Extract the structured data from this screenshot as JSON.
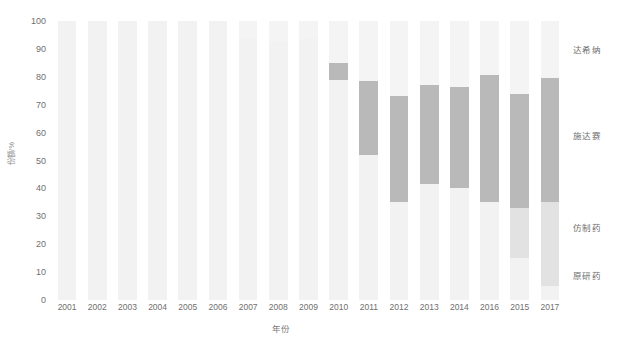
{
  "chart_data": {
    "type": "bar",
    "stacked": true,
    "title": "",
    "xlabel": "年份",
    "ylabel": "份额/%",
    "ylim": [
      0,
      100
    ],
    "yticks": [
      0,
      10,
      20,
      30,
      40,
      50,
      60,
      70,
      80,
      90,
      100
    ],
    "grid": false,
    "legend_position": "right",
    "categories": [
      "2001",
      "2002",
      "2003",
      "2004",
      "2005",
      "2006",
      "2007",
      "2008",
      "2009",
      "2010",
      "2011",
      "2012",
      "2013",
      "2014",
      "2016",
      "2015",
      "2017"
    ],
    "series": [
      {
        "name": "原研药",
        "color": "#f2f2f2",
        "values": [
          100,
          100,
          100,
          100,
          100,
          100,
          94,
          92.5,
          93.5,
          79,
          52,
          35,
          41.5,
          40,
          35,
          15,
          5
        ]
      },
      {
        "name": "仿制药",
        "color": "#e2e2e2",
        "values": [
          0,
          0,
          0,
          0,
          0,
          0,
          0,
          0,
          0,
          0,
          0,
          0,
          0,
          0,
          0,
          18,
          30
        ]
      },
      {
        "name": "施达赛",
        "color": "#b9b9b9",
        "values": [
          0,
          0,
          0,
          0,
          0,
          0,
          0,
          0,
          0,
          6,
          26.5,
          38,
          35.5,
          36.5,
          45.5,
          41,
          44.5
        ]
      },
      {
        "name": "达希纳",
        "color": "#f4f4f4",
        "values": [
          0,
          0,
          0,
          0,
          0,
          0,
          6,
          7.5,
          6.5,
          15,
          21.5,
          27,
          23,
          23.5,
          19.5,
          26,
          20.5
        ]
      }
    ],
    "legend_labels": [
      "达希纳",
      "施达赛",
      "仿制药",
      "原研药"
    ],
    "legend_y_percent": [
      90,
      59,
      26,
      9
    ]
  },
  "colors": {
    "tick_text": "#6f6f6f",
    "axis_label": "#7a7a7a",
    "legend_text": "#6d6d6d",
    "background": "#ffffff"
  }
}
